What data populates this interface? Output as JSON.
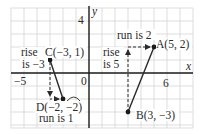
{
  "graph": {
    "origin_px": [
      89,
      73
    ],
    "unit_px": 13,
    "x_range": [
      -6,
      8
    ],
    "y_range": [
      -4.2,
      5.2
    ],
    "axis_labels": {
      "x": "x",
      "y": "y"
    },
    "tick_labels": {
      "x_neg": "−5",
      "origin": "0",
      "x_pos": "6",
      "y_pos": "4"
    },
    "colors": {
      "grid": "#d4d4d4",
      "axis": "#1a1a1a",
      "line": "#2a2a2a"
    }
  },
  "points": [
    {
      "id": "A",
      "label": "A(5, 2)",
      "x": 5,
      "y": 2
    },
    {
      "id": "B",
      "label": "B(3, −3)",
      "x": 3,
      "y": -3
    },
    {
      "id": "C",
      "label": "C(−3, 1)",
      "x": -3,
      "y": 1
    },
    {
      "id": "D",
      "label": "D(−2, −2)",
      "x": -2,
      "y": -2
    }
  ],
  "segments": [
    {
      "from": "B",
      "to": "A"
    },
    {
      "from": "C",
      "to": "D"
    }
  ],
  "annotations": {
    "left_rise_line1": "rise",
    "left_rise_line2": "is −3",
    "left_run": "run is 1",
    "right_rise_line1": "rise",
    "right_rise_line2": "is 5",
    "right_run": "run is 2"
  }
}
